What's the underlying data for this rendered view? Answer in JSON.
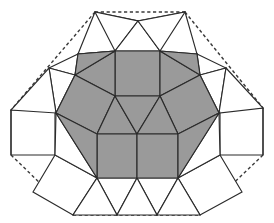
{
  "figure": {
    "width": 274,
    "height": 223,
    "background_color": "#ffffff"
  },
  "colors": {
    "shaded_fill": "#9a9a9a",
    "white_fill": "#ffffff",
    "edge_stroke": "#2b2b2b",
    "dashed_stroke": "#3a3a3a"
  },
  "chart_data": {
    "type": "diagram",
    "xlabel": "",
    "ylabel": "",
    "grid": false,
    "legend": "none",
    "xlim": [
      0,
      274
    ],
    "ylim": [
      0,
      223
    ],
    "counts": {
      "shaded_faces": 14,
      "white_faces": 20,
      "dashed_boundary_segments": 6
    },
    "shaded_faces": [
      {
        "name": "core-square-top",
        "kind": "square",
        "points": "115,51 160,51 160,96 115,96"
      },
      {
        "name": "core-upper-left-trap",
        "kind": "triangle",
        "points": "115,51 115,96 75,75"
      },
      {
        "name": "core-upper-left-wing",
        "kind": "triangle",
        "points": "115,51 75,75 78,54"
      },
      {
        "name": "core-upper-right-trap",
        "kind": "triangle",
        "points": "160,51 200,75 160,96"
      },
      {
        "name": "core-upper-right-wing",
        "kind": "triangle",
        "points": "160,51 197,54 200,75"
      },
      {
        "name": "core-left-square",
        "kind": "square",
        "points": "75,75 115,96 97,134 56,113"
      },
      {
        "name": "core-right-square",
        "kind": "square",
        "points": "200,75 219,113 178,134 160,96"
      },
      {
        "name": "core-mid-tri-left",
        "kind": "triangle",
        "points": "115,96 97,134 137,134"
      },
      {
        "name": "core-mid-tri-center",
        "kind": "triangle",
        "points": "115,96 137,134 160,96"
      },
      {
        "name": "core-mid-tri-right",
        "kind": "triangle",
        "points": "160,96 137,134 178,134"
      },
      {
        "name": "core-bottom-square-left",
        "kind": "square",
        "points": "97,134 137,134 137,178 97,178"
      },
      {
        "name": "core-bottom-square-right",
        "kind": "square",
        "points": "137,134 178,134 178,178 137,178"
      },
      {
        "name": "core-bottom-left-tri",
        "kind": "triangle",
        "points": "56,113 97,134 97,178"
      },
      {
        "name": "core-bottom-right-tri",
        "kind": "triangle",
        "points": "219,113 178,178 178,134"
      }
    ],
    "white_faces": [
      {
        "name": "outer-square-top-left",
        "kind": "square",
        "points": "78,54 95,12 138,21 115,51"
      },
      {
        "name": "outer-square-top-right",
        "kind": "square",
        "points": "197,54 160,51 138,21 185,12"
      },
      {
        "name": "outer-tri-top-left-a",
        "kind": "triangle",
        "points": "95,12 138,21 115,51"
      },
      {
        "name": "outer-tri-top-center",
        "kind": "triangle",
        "points": "138,21 160,51 115,51"
      },
      {
        "name": "outer-tri-top-right-a",
        "kind": "triangle",
        "points": "138,21 185,12 160,51"
      },
      {
        "name": "outer-tri-upper-left",
        "kind": "triangle",
        "points": "78,54 115,51 75,75"
      },
      {
        "name": "outer-tri-upper-right",
        "kind": "triangle",
        "points": "197,54 200,75 160,96"
      },
      {
        "name": "outer-square-left-mid",
        "kind": "square",
        "points": "11,110 55,110 55,155 11,155"
      },
      {
        "name": "outer-square-right-mid",
        "kind": "square",
        "points": "220,108 263,108 263,155 220,155"
      },
      {
        "name": "outer-tri-left-upper",
        "kind": "triangle",
        "points": "49,68 78,54 75,75"
      },
      {
        "name": "outer-tri-left-mid-a",
        "kind": "triangle",
        "points": "49,68 75,75 56,113"
      },
      {
        "name": "outer-tri-left-mid-b",
        "kind": "triangle",
        "points": "49,68 56,113 11,110"
      },
      {
        "name": "outer-tri-right-upper",
        "kind": "triangle",
        "points": "197,54 226,68 200,75"
      },
      {
        "name": "outer-tri-right-mid-a",
        "kind": "triangle",
        "points": "226,68 219,113 200,75"
      },
      {
        "name": "outer-tri-right-mid-b",
        "kind": "triangle",
        "points": "226,68 263,108 219,113"
      },
      {
        "name": "outer-square-bottom-left",
        "kind": "square",
        "points": "55,155 97,178 73,215 33,192"
      },
      {
        "name": "outer-square-bottom-right",
        "kind": "square",
        "points": "220,155 242,192 200,215 178,178"
      },
      {
        "name": "outer-tri-bottom-left",
        "kind": "triangle",
        "points": "55,155 56,113 97,178"
      },
      {
        "name": "outer-tri-bottom-a",
        "kind": "triangle",
        "points": "97,178 137,178 117,215"
      },
      {
        "name": "outer-tri-bottom-b",
        "kind": "triangle",
        "points": "137,178 178,178 157,215"
      },
      {
        "name": "outer-tri-bottom-left-v",
        "kind": "triangle",
        "points": "97,178 117,215 73,215"
      },
      {
        "name": "outer-tri-bottom-mid-v",
        "kind": "triangle",
        "points": "137,178 157,215 117,215"
      },
      {
        "name": "outer-tri-bottom-right-v",
        "kind": "triangle",
        "points": "178,178 200,215 157,215"
      },
      {
        "name": "outer-tri-bottom-right",
        "kind": "triangle",
        "points": "220,155 178,178 219,113"
      }
    ],
    "dashed_boundary": [
      {
        "name": "dash-top",
        "points": "95,12 185,12"
      },
      {
        "name": "dash-upper-left",
        "points": "95,12 11,110"
      },
      {
        "name": "dash-upper-right",
        "points": "185,12 263,108"
      },
      {
        "name": "dash-lower-left",
        "points": "11,155 73,215"
      },
      {
        "name": "dash-lower-right",
        "points": "263,155 200,215"
      },
      {
        "name": "dash-bottom",
        "points": "73,215 200,215"
      }
    ],
    "interior_edges": [
      {
        "name": "edge-left-square-diag",
        "points": "11,110 11,155"
      },
      {
        "name": "edge-right-square-diag",
        "points": "263,108 263,155"
      }
    ]
  }
}
